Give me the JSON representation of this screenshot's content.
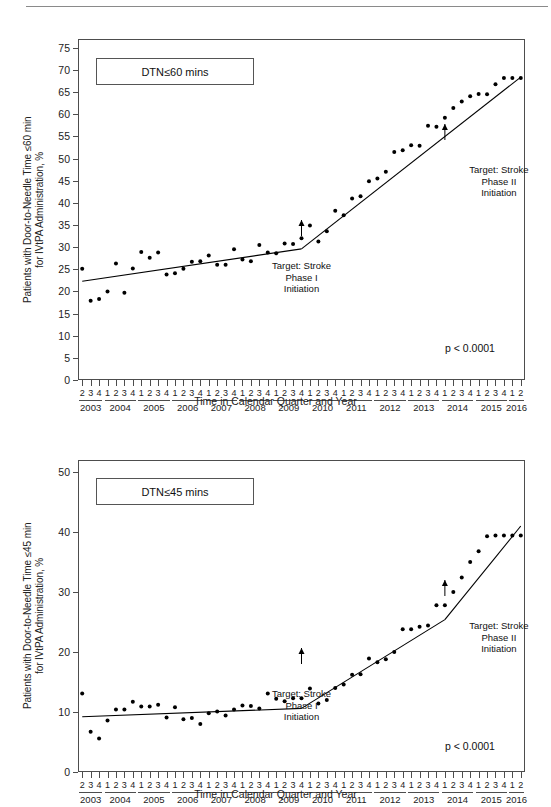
{
  "figure": {
    "axis_title": "Time in Calendar Quarter and Year",
    "quarters": [
      "2",
      "3",
      "4",
      "1",
      "2",
      "3",
      "4",
      "1",
      "2",
      "3",
      "4",
      "1",
      "2",
      "3",
      "4",
      "1",
      "2",
      "3",
      "4",
      "1",
      "2",
      "3",
      "4",
      "1",
      "2",
      "3",
      "4",
      "1",
      "2",
      "3",
      "4",
      "1",
      "2",
      "3",
      "4",
      "1",
      "2",
      "3",
      "4",
      "1",
      "2",
      "3",
      "4",
      "1",
      "2",
      "3",
      "4",
      "1",
      "2",
      "3",
      "4",
      "1",
      "2"
    ],
    "years": [
      "2003",
      "2004",
      "2005",
      "2006",
      "2007",
      "2008",
      "2009",
      "2010",
      "2011",
      "2012",
      "2013",
      "2014",
      "2015",
      "2016"
    ],
    "year_spans": [
      3,
      4,
      4,
      4,
      4,
      4,
      4,
      4,
      4,
      4,
      4,
      4,
      4,
      2
    ],
    "annotations": {
      "phase1": "Target: Stroke\nPhase I\nInitiation",
      "phase2": "Target: Stroke\nPhase II\nInitiation"
    },
    "pvalue": "p < 0.0001"
  },
  "chart_data": [
    {
      "id": "dtn60",
      "type": "scatter",
      "title": "DTN≤60 mins",
      "xlabel": "Time in Calendar Quarter and Year",
      "ylabel": "Patients with Door-to-Needle Time ≤60 min\nfor IVtPA Administration, %",
      "ylim": [
        0,
        77
      ],
      "yticks": [
        0,
        5,
        10,
        15,
        20,
        25,
        30,
        35,
        40,
        45,
        50,
        55,
        60,
        65,
        70,
        75
      ],
      "grid": false,
      "legend": "none",
      "x": [
        "2003 Q2",
        "2003 Q3",
        "2003 Q4",
        "2004 Q1",
        "2004 Q2",
        "2004 Q3",
        "2004 Q4",
        "2005 Q1",
        "2005 Q2",
        "2005 Q3",
        "2005 Q4",
        "2006 Q1",
        "2006 Q2",
        "2006 Q3",
        "2006 Q4",
        "2007 Q1",
        "2007 Q2",
        "2007 Q3",
        "2007 Q4",
        "2008 Q1",
        "2008 Q2",
        "2008 Q3",
        "2008 Q4",
        "2009 Q1",
        "2009 Q2",
        "2009 Q3",
        "2009 Q4",
        "2010 Q1",
        "2010 Q2",
        "2010 Q3",
        "2010 Q4",
        "2011 Q1",
        "2011 Q2",
        "2011 Q3",
        "2011 Q4",
        "2012 Q1",
        "2012 Q2",
        "2012 Q3",
        "2012 Q4",
        "2013 Q1",
        "2013 Q2",
        "2013 Q3",
        "2013 Q4",
        "2014 Q1",
        "2014 Q2",
        "2014 Q3",
        "2014 Q4",
        "2015 Q1",
        "2015 Q2",
        "2015 Q3",
        "2015 Q4",
        "2016 Q1",
        "2016 Q2"
      ],
      "values": [
        25.1,
        17.9,
        18.3,
        20.0,
        26.3,
        19.7,
        25.2,
        28.9,
        27.6,
        28.8,
        23.8,
        24.1,
        25.1,
        26.7,
        26.8,
        28.1,
        26.0,
        26.0,
        29.5,
        27.2,
        26.8,
        30.5,
        28.8,
        28.6,
        30.8,
        30.7,
        32.0,
        34.9,
        31.3,
        33.6,
        38.2,
        37.2,
        41.0,
        41.5,
        44.9,
        45.5,
        47.0,
        51.5,
        51.9,
        53.0,
        52.9,
        57.4,
        57.2,
        59.2,
        61.4,
        62.9,
        64.1,
        64.6,
        64.5,
        66.8,
        68.2,
        68.2,
        68.2
      ],
      "trend_segments": [
        {
          "name": "pre-Phase I",
          "from": "2003 Q2",
          "to": "2009 Q4",
          "y_from": 22.3,
          "y_to": 29.6
        },
        {
          "name": "Phase I to end",
          "from": "2009 Q4",
          "to": "2016 Q2",
          "y_from": 29.6,
          "y_to": 68.4
        }
      ],
      "markers": [
        {
          "label": "Target: Stroke\nPhase I\nInitiation",
          "at": "2009 Q4",
          "y": 29.6
        },
        {
          "label": "Target: Stroke\nPhase II\nInitiation",
          "at": "2014 Q1",
          "y": 55.0
        }
      ],
      "pvalue": "p < 0.0001"
    },
    {
      "id": "dtn45",
      "type": "scatter",
      "title": "DTN≤45 mins",
      "xlabel": "Time in Calendar Quarter and Year",
      "ylabel": "Patients with Door-to-Needle Time ≤45 min\nfor IVtPA Administration, %",
      "ylim": [
        0,
        52
      ],
      "yticks": [
        0,
        10,
        20,
        30,
        40,
        50
      ],
      "grid": false,
      "legend": "none",
      "x": [
        "2003 Q2",
        "2003 Q3",
        "2003 Q4",
        "2004 Q1",
        "2004 Q2",
        "2004 Q3",
        "2004 Q4",
        "2005 Q1",
        "2005 Q2",
        "2005 Q3",
        "2005 Q4",
        "2006 Q1",
        "2006 Q2",
        "2006 Q3",
        "2006 Q4",
        "2007 Q1",
        "2007 Q2",
        "2007 Q3",
        "2007 Q4",
        "2008 Q1",
        "2008 Q2",
        "2008 Q3",
        "2008 Q4",
        "2009 Q1",
        "2009 Q2",
        "2009 Q3",
        "2009 Q4",
        "2010 Q1",
        "2010 Q2",
        "2010 Q3",
        "2010 Q4",
        "2011 Q1",
        "2011 Q2",
        "2011 Q3",
        "2011 Q4",
        "2012 Q1",
        "2012 Q2",
        "2012 Q3",
        "2012 Q4",
        "2013 Q1",
        "2013 Q2",
        "2013 Q3",
        "2013 Q4",
        "2014 Q1",
        "2014 Q2",
        "2014 Q3",
        "2014 Q4",
        "2015 Q1",
        "2015 Q2",
        "2015 Q3",
        "2015 Q4",
        "2016 Q1",
        "2016 Q2"
      ],
      "values": [
        13.1,
        6.7,
        5.6,
        8.6,
        10.4,
        10.4,
        11.7,
        10.9,
        10.9,
        11.2,
        9.1,
        10.8,
        8.8,
        9.0,
        8.0,
        9.8,
        10.1,
        9.4,
        10.4,
        11.1,
        11.0,
        10.6,
        13.1,
        12.2,
        11.8,
        12.3,
        12.3,
        13.9,
        11.4,
        12.0,
        14.0,
        14.6,
        16.2,
        16.3,
        18.9,
        18.3,
        18.8,
        20.0,
        23.8,
        23.8,
        24.2,
        24.4,
        27.8,
        27.8,
        30.0,
        32.4,
        35.0,
        36.8,
        39.3,
        39.4,
        39.4,
        39.4,
        39.4
      ],
      "trend_segments": [
        {
          "name": "pre-Phase I",
          "from": "2003 Q2",
          "to": "2009 Q4",
          "y_from": 9.2,
          "y_to": 10.6
        },
        {
          "name": "Phase I to Phase II",
          "from": "2009 Q4",
          "to": "2014 Q1",
          "y_from": 10.6,
          "y_to": 25.4
        },
        {
          "name": "Phase II to end",
          "from": "2014 Q1",
          "to": "2016 Q2",
          "y_from": 25.4,
          "y_to": 41.0
        }
      ],
      "markers": [
        {
          "label": "Target: Stroke\nPhase I\nInitiation",
          "at": "2009 Q4",
          "y": 10.6
        },
        {
          "label": "Target: Stroke\nPhase II\nInitiation",
          "at": "2014 Q1",
          "y": 25.4
        }
      ],
      "pvalue": "p < 0.0001"
    }
  ]
}
